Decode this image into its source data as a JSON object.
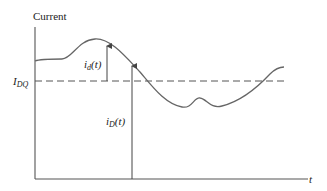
{
  "diagram": {
    "y_axis_label": "Current",
    "x_axis_label": "t",
    "dc_level_label_main": "I",
    "dc_level_label_sub": "DQ",
    "ac_component_label_main": "i",
    "ac_component_label_sub": "d",
    "ac_component_label_arg": "(t)",
    "total_current_label_main": "i",
    "total_current_label_sub": "D",
    "total_current_label_arg": "(t)",
    "colors": {
      "axis": "#555555",
      "curve": "#666666",
      "dashed": "#555555",
      "text": "#222222"
    }
  }
}
